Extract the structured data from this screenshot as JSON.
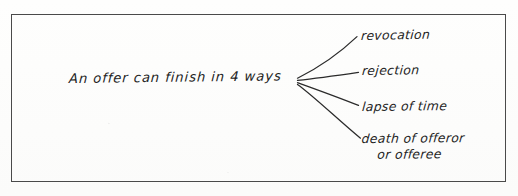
{
  "diagram": {
    "title_text": "An offer can finish in 4 ways",
    "central": {
      "text": "An offer can finish in 4 ways"
    },
    "branches": [
      {
        "label": "revocation"
      },
      {
        "label": "rejection"
      },
      {
        "label": "lapse of time"
      },
      {
        "label": "death of offeror",
        "label_line2": "or offeree"
      }
    ],
    "frame": {
      "border_color": "#4a4a4a"
    },
    "ink_color": "#232323",
    "background_color": "#fdfdfc"
  }
}
